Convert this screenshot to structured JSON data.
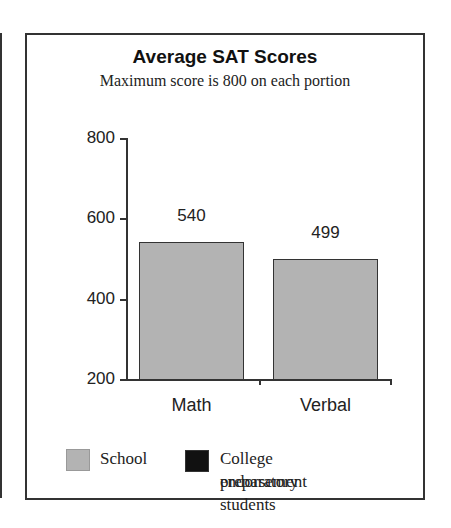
{
  "chart_data": {
    "type": "bar",
    "title": "Average SAT Scores",
    "subtitle": "Maximum score is 800 on each portion",
    "categories": [
      "Math",
      "Verbal"
    ],
    "series": [
      {
        "name": "School",
        "values": [
          540,
          499
        ],
        "color": "#b3b3b3"
      },
      {
        "name": "College preparatory endorsement students",
        "values": [
          null,
          null
        ],
        "color": "#111111"
      }
    ],
    "xlabel": "",
    "ylabel": "",
    "ylim": [
      200,
      800
    ],
    "yticks": [
      200,
      400,
      600,
      800
    ],
    "grid": false,
    "legend_position": "bottom",
    "data_labels": [
      "540",
      "499"
    ]
  },
  "legend": {
    "school_label": "School",
    "college_label_line1": "College preparatory",
    "college_label_line2": "endorsement students"
  },
  "yticks_text": [
    "800",
    "600",
    "400",
    "200"
  ]
}
